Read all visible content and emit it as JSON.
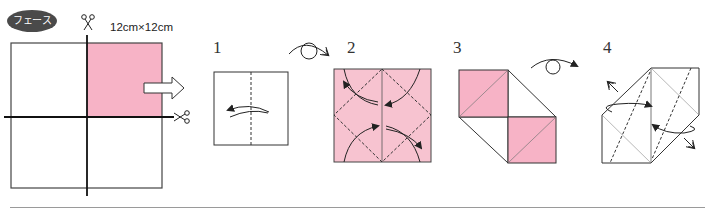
{
  "header": {
    "badge_label": "フェース",
    "paper_size": "12cm×12cm"
  },
  "colors": {
    "pink": "#f7b3c6",
    "light_pink": "#f7c3d0",
    "line": "#333333",
    "badge_bg": "#4a4a4a"
  },
  "steps": [
    {
      "number": "1",
      "description": "valley fold in half (dashed vertical line), arrow folding left"
    },
    {
      "number": "2",
      "description": "pink square with dashed diamond, four curved arrows folding corners"
    },
    {
      "number": "3",
      "description": "two pink squares offset diagonally with white triangle flaps"
    },
    {
      "number": "4",
      "description": "hexagonal shape with dashed diagonal folds and opposing arrows"
    }
  ],
  "icons": {
    "scissors_top": "scissors-icon",
    "scissors_right": "scissors-icon",
    "move_arrow": "hollow-right-arrow-icon",
    "flip_1": "turn-over-icon",
    "flip_3": "turn-over-icon"
  }
}
